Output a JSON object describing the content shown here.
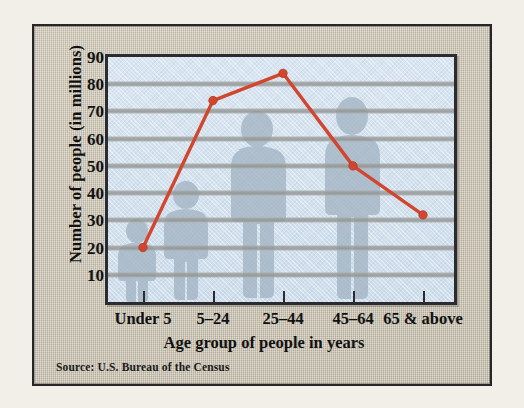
{
  "figure": {
    "source_note": "Source: U.S. Bureau of the Census",
    "accent_color": "#d2462f",
    "plot_bg_color": "#d5e3ef",
    "gridline_color": "#989a99",
    "frame_color": "#c8c0ad",
    "silhouette_color": "#9fb0c0"
  },
  "chart_data": {
    "type": "line",
    "title": "",
    "subtitle": "",
    "xlabel": "Age group of people in years",
    "ylabel": "Number of people (in millions)",
    "categories": [
      "Under 5",
      "5–24",
      "25–44",
      "45–64",
      "65 & above"
    ],
    "values": [
      20,
      74,
      84,
      50,
      32
    ],
    "series": [
      {
        "name": "Number of people",
        "values": [
          20,
          74,
          84,
          50,
          32
        ]
      }
    ],
    "ylim": [
      0,
      90
    ],
    "yticks": [
      10,
      20,
      30,
      40,
      50,
      60,
      70,
      80,
      90
    ],
    "ytick_labels": [
      "10",
      "20",
      "30",
      "40",
      "50",
      "60",
      "70",
      "80",
      "90"
    ],
    "grid": "horizontal",
    "legend": "none",
    "marker": "circle",
    "line_color": "#d2462f",
    "annotations": []
  }
}
